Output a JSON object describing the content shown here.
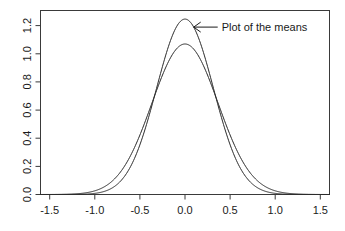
{
  "chart_data": {
    "type": "line",
    "title": "",
    "xlabel": "",
    "ylabel": "",
    "xlim": [
      -1.6,
      1.6
    ],
    "ylim": [
      0.0,
      1.33
    ],
    "grid": false,
    "legend": null,
    "xticks": [
      -1.5,
      -1.0,
      -0.5,
      0.0,
      0.5,
      1.0,
      1.5
    ],
    "xtick_labels": [
      "-1.5",
      "-1.0",
      "-0.5",
      "0.0",
      "0.5",
      "1.0",
      "1.5"
    ],
    "yticks": [
      0.0,
      0.2,
      0.4,
      0.6,
      0.8,
      1.0,
      1.2
    ],
    "ytick_labels": [
      "0.0",
      "0.2",
      "0.4",
      "0.6",
      "0.8",
      "1.0",
      "1.2"
    ],
    "series": [
      {
        "name": "means-density",
        "type": "normal-density",
        "mean": 0.0,
        "sigma": 0.3145,
        "peak": 1.268,
        "x": [
          -1.5,
          -1.4,
          -1.3,
          -1.2,
          -1.1,
          -1.0,
          -0.9,
          -0.8,
          -0.7,
          -0.6,
          -0.5,
          -0.4,
          -0.3,
          -0.2,
          -0.1,
          0.0,
          0.1,
          0.2,
          0.3,
          0.4,
          0.5,
          0.6,
          0.7,
          0.8,
          0.9,
          1.0,
          1.1,
          1.2,
          1.3,
          1.4,
          1.5
        ],
        "values": [
          0.0,
          0.001,
          0.002,
          0.006,
          0.017,
          0.041,
          0.09,
          0.175,
          0.301,
          0.459,
          0.619,
          0.776,
          0.816,
          0.988,
          1.206,
          1.268,
          1.206,
          0.988,
          0.816,
          0.776,
          0.619,
          0.459,
          0.301,
          0.175,
          0.09,
          0.041,
          0.017,
          0.006,
          0.002,
          0.001,
          0.0
        ]
      },
      {
        "name": "wider-density",
        "type": "normal-density",
        "mean": 0.0,
        "sigma": 0.3665,
        "peak": 1.088,
        "x": [
          -1.5,
          -1.4,
          -1.3,
          -1.2,
          -1.1,
          -1.0,
          -0.9,
          -0.8,
          -0.7,
          -0.6,
          -0.5,
          -0.4,
          -0.3,
          -0.2,
          -0.1,
          0.0,
          0.1,
          0.2,
          0.3,
          0.4,
          0.5,
          0.6,
          0.7,
          0.8,
          0.9,
          1.0,
          1.1,
          1.2,
          1.3,
          1.4,
          1.5
        ],
        "values": [
          0.001,
          0.003,
          0.008,
          0.019,
          0.042,
          0.084,
          0.155,
          0.259,
          0.397,
          0.557,
          0.713,
          0.855,
          0.962,
          1.035,
          1.074,
          1.088,
          1.074,
          1.035,
          0.962,
          0.855,
          0.713,
          0.557,
          0.397,
          0.259,
          0.155,
          0.084,
          0.042,
          0.019,
          0.008,
          0.003,
          0.001
        ]
      }
    ],
    "annotations": [
      {
        "name": "plot-of-the-means",
        "text": "Plot of the means",
        "target_x": 0.03,
        "target_y": 1.21,
        "arrow": "left"
      }
    ]
  },
  "colors": {
    "curve": "#2b2b2b",
    "axis": "#3a3a3a",
    "text": "#1a1a1a",
    "background": "#ffffff"
  }
}
